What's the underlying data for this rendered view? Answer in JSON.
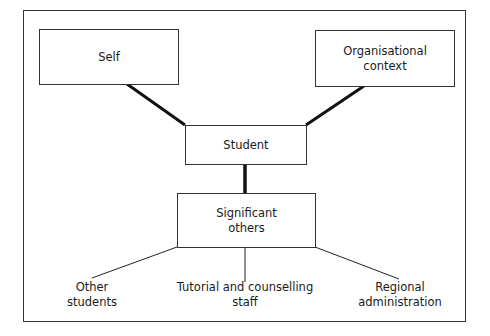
{
  "diagram": {
    "nodes": {
      "self": {
        "label": "Self"
      },
      "organisational_context": {
        "label": "Organisational\ncontext"
      },
      "student": {
        "label": "Student"
      },
      "significant_others": {
        "label": "Significant\nothers"
      }
    },
    "leaves": {
      "other_students": {
        "label": "Other\nstudents"
      },
      "tutorial_staff": {
        "label": "Tutorial and counselling\nstaff"
      },
      "regional_administration": {
        "label": "Regional\nadministration"
      }
    },
    "edges": [
      {
        "from": "self",
        "to": "student",
        "style": "thick"
      },
      {
        "from": "organisational_context",
        "to": "student",
        "style": "thick"
      },
      {
        "from": "student",
        "to": "significant_others",
        "style": "thick"
      },
      {
        "from": "significant_others",
        "to": "other_students",
        "style": "thin"
      },
      {
        "from": "significant_others",
        "to": "tutorial_staff",
        "style": "thin"
      },
      {
        "from": "significant_others",
        "to": "regional_administration",
        "style": "thin"
      }
    ],
    "colors": {
      "line": "#111111",
      "border": "#333333",
      "background": "#ffffff"
    }
  }
}
